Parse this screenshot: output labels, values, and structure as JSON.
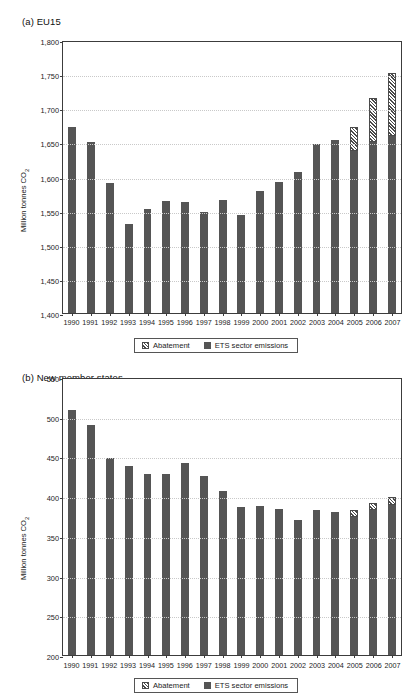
{
  "chart_data": [
    {
      "type": "bar",
      "panel_id": "a",
      "title": "(a) EU15",
      "xlabel": "",
      "ylabel": "Million tonnes CO2",
      "ylabel_display": "Million tonnes CO",
      "ylabel_sub": "2",
      "ylim": [
        1400,
        1800
      ],
      "ytick_step": 50,
      "ytick_labels": [
        "1,800",
        "1,750",
        "1,700",
        "1,650",
        "1,600",
        "1,550",
        "1,500",
        "1,450",
        "1,400"
      ],
      "ytick_values": [
        1800,
        1750,
        1700,
        1650,
        1600,
        1550,
        1500,
        1450,
        1400
      ],
      "grid": true,
      "legend_position": "bottom-center",
      "categories": [
        "1990",
        "1991",
        "1992",
        "1993",
        "1994",
        "1995",
        "1996",
        "1997",
        "1998",
        "1999",
        "2000",
        "2001",
        "2002",
        "2003",
        "2004",
        "2005",
        "2006",
        "2007"
      ],
      "series": [
        {
          "name": "ETS sector emissions",
          "color": "#555555",
          "values": [
            1673,
            1651,
            1591,
            1531,
            1553,
            1564,
            1562,
            1548,
            1566,
            1543,
            1579,
            1592,
            1606,
            1648,
            1653,
            1638,
            1651,
            1660
          ]
        },
        {
          "name": "Abatement",
          "color": "#4a4a4a",
          "fill": "hatched",
          "values": [
            0,
            0,
            0,
            0,
            0,
            0,
            0,
            0,
            0,
            0,
            0,
            0,
            0,
            0,
            0,
            35,
            64,
            92
          ]
        }
      ]
    },
    {
      "type": "bar",
      "panel_id": "b",
      "title": "(b) New member states",
      "xlabel": "",
      "ylabel": "Million tonnes CO2",
      "ylabel_display": "Million tonnes CO",
      "ylabel_sub": "2",
      "ylim": [
        200,
        550
      ],
      "ytick_step": 50,
      "ytick_labels": [
        "550",
        "500",
        "450",
        "400",
        "350",
        "300",
        "250",
        "200"
      ],
      "ytick_values": [
        550,
        500,
        450,
        400,
        350,
        300,
        250,
        200
      ],
      "grid": true,
      "legend_position": "bottom-center",
      "categories": [
        "1990",
        "1991",
        "1992",
        "1993",
        "1994",
        "1995",
        "1996",
        "1997",
        "1998",
        "1999",
        "2000",
        "2001",
        "2002",
        "2003",
        "2004",
        "2005",
        "2006",
        "2007"
      ],
      "series": [
        {
          "name": "ETS sector emissions",
          "color": "#555555",
          "values": [
            509,
            490,
            448,
            438,
            428,
            428,
            442,
            426,
            406,
            386,
            388,
            384,
            370,
            383,
            380,
            374,
            383,
            389
          ]
        },
        {
          "name": "Abatement",
          "color": "#4a4a4a",
          "fill": "hatched",
          "values": [
            0,
            0,
            0,
            0,
            0,
            0,
            0,
            0,
            0,
            0,
            0,
            0,
            0,
            0,
            0,
            8,
            9,
            10
          ]
        }
      ]
    }
  ],
  "legend": {
    "abatement_label": "Abatement",
    "ets_label": "ETS sector emissions"
  }
}
